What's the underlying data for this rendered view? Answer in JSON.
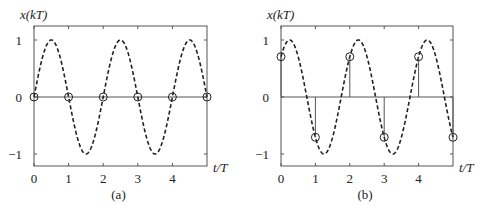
{
  "chart_data": [
    {
      "type": "line",
      "panel": "a",
      "caption": "(a)",
      "title": "",
      "xlabel": "t/T",
      "ylabel": "x(kT)",
      "xlim": [
        0,
        5
      ],
      "ylim": [
        -1.2,
        1.2
      ],
      "xticks": [
        0,
        1,
        2,
        3,
        4
      ],
      "xtick_labels": [
        "0",
        "1",
        "2",
        "3",
        "4"
      ],
      "yticks": [
        -1,
        0,
        1
      ],
      "ytick_labels": [
        "−1",
        "0",
        "1"
      ],
      "grid": false,
      "continuous_signal": {
        "name": "x(t) = sin(π t/T)",
        "style": "dashed",
        "frequency_cycles_per_T": 0.5,
        "phase_rad": 0,
        "amplitude": 1
      },
      "samples": {
        "style": "stem-circle",
        "k": [
          0,
          1,
          2,
          3,
          4,
          5
        ],
        "values": [
          0,
          0,
          0,
          0,
          0,
          0
        ]
      }
    },
    {
      "type": "line",
      "panel": "b",
      "caption": "(b)",
      "title": "",
      "xlabel": "t/T",
      "ylabel": "x(kT)",
      "xlim": [
        0,
        5
      ],
      "ylim": [
        -1.2,
        1.2
      ],
      "xticks": [
        0,
        1,
        2,
        3,
        4
      ],
      "xtick_labels": [
        "0",
        "1",
        "2",
        "3",
        "4"
      ],
      "yticks": [
        -1,
        0,
        1
      ],
      "ytick_labels": [
        "−1",
        "0",
        "1"
      ],
      "grid": false,
      "continuous_signal": {
        "name": "x(t) = sin(π t/T + π/4)",
        "style": "dashed",
        "frequency_cycles_per_T": 0.5,
        "phase_rad": 0.7854,
        "amplitude": 1
      },
      "samples": {
        "style": "stem-circle",
        "k": [
          0,
          1,
          2,
          3,
          4,
          5
        ],
        "values": [
          0.707,
          -0.707,
          0.707,
          -0.707,
          0.707,
          -0.707
        ]
      }
    }
  ],
  "layout": {
    "panels": [
      {
        "left": 34,
        "right": 207,
        "top": 26,
        "bottom": 166,
        "y_zero": 97,
        "y_unit": 57
      },
      {
        "left": 281,
        "right": 453,
        "top": 26,
        "bottom": 166,
        "y_zero": 97,
        "y_unit": 57
      }
    ],
    "colors": {
      "axis": "#555555",
      "curve": "#222222",
      "stem": "#555555"
    }
  }
}
